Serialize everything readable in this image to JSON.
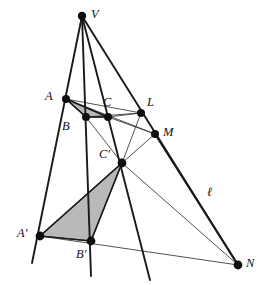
{
  "figure": {
    "width": 267,
    "height": 285,
    "background": "#ffffff",
    "stroke_color": "#1a1a1a",
    "thin_stroke_color": "#333333",
    "shade_color": "#b9b9b9",
    "shade_stroke": "#2a2a2a",
    "label_color": "#111111"
  },
  "points": [
    {
      "id": "V",
      "label": "V",
      "x": 82,
      "y": 16,
      "r": 4.2,
      "label_x": 91,
      "label_y": 8
    },
    {
      "id": "A",
      "label": "A",
      "x": 66,
      "y": 99,
      "r": 4.0,
      "label_x": 45,
      "label_y": 90
    },
    {
      "id": "B",
      "label": "B",
      "x": 86,
      "y": 117,
      "r": 4.0,
      "label_x": 62,
      "label_y": 120
    },
    {
      "id": "C",
      "label": "C",
      "x": 108,
      "y": 117,
      "r": 4.0,
      "label_x": 103,
      "label_y": 96
    },
    {
      "id": "L",
      "label": "L",
      "x": 141,
      "y": 113,
      "r": 4.0,
      "label_x": 147,
      "label_y": 96
    },
    {
      "id": "M",
      "label": "M",
      "x": 155,
      "y": 134,
      "r": 4.0,
      "label_x": 163,
      "label_y": 126
    },
    {
      "id": "Cp",
      "label": "C′",
      "x": 122,
      "y": 163,
      "r": 4.4,
      "label_x": 99,
      "label_y": 148
    },
    {
      "id": "Ap",
      "label": "A′",
      "x": 40,
      "y": 236,
      "r": 4.4,
      "label_x": 17,
      "label_y": 227
    },
    {
      "id": "Bp",
      "label": "B′",
      "x": 91,
      "y": 241,
      "r": 4.4,
      "label_x": 76,
      "label_y": 248
    },
    {
      "id": "N",
      "label": "N",
      "x": 238,
      "y": 265,
      "r": 4.4,
      "label_x": 246,
      "label_y": 257
    }
  ],
  "line_label": {
    "id": "ell",
    "label": "ℓ",
    "x": 207,
    "y": 186
  },
  "shaded_triangles": [
    {
      "id": "triangle-ABC",
      "vertices": "A,B,C",
      "points": "66,99 86,117 108,117"
    },
    {
      "id": "triangle-ApBpCp",
      "vertices": "A',B',C'",
      "points": "40,236 91,241 122,163"
    }
  ],
  "segments": [
    {
      "id": "V-A-Ap-ext",
      "from": "V",
      "to": "beyond A'",
      "weight": "thick",
      "x1": 82,
      "y1": 16,
      "x2": 32,
      "y2": 263
    },
    {
      "id": "V-B-Bp-ext",
      "from": "V",
      "to": "beyond B'",
      "weight": "thick",
      "x1": 82,
      "y1": 16,
      "x2": 91,
      "y2": 276
    },
    {
      "id": "V-C-Cp-ext",
      "from": "V",
      "to": "beyond C'",
      "weight": "thick",
      "x1": 82,
      "y1": 16,
      "x2": 150,
      "y2": 280
    },
    {
      "id": "V-L-N",
      "from": "V",
      "to": "N",
      "weight": "thick",
      "x1": 82,
      "y1": 16,
      "x2": 238,
      "y2": 265
    },
    {
      "id": "A-L-line",
      "from": "A",
      "to": "L",
      "weight": "thin",
      "x1": 66,
      "y1": 99,
      "x2": 141,
      "y2": 113
    },
    {
      "id": "B-L-line",
      "from": "B",
      "to": "L",
      "weight": "thin",
      "x1": 86,
      "y1": 117,
      "x2": 141,
      "y2": 113
    },
    {
      "id": "A-M-line",
      "from": "A",
      "to": "M",
      "weight": "thin",
      "x1": 66,
      "y1": 99,
      "x2": 155,
      "y2": 134
    },
    {
      "id": "C-M-line",
      "from": "C",
      "to": "M",
      "weight": "thin",
      "x1": 108,
      "y1": 117,
      "x2": 155,
      "y2": 134
    },
    {
      "id": "L-Cp-line",
      "from": "L",
      "to": "C'",
      "weight": "thin",
      "x1": 141,
      "y1": 113,
      "x2": 122,
      "y2": 163
    },
    {
      "id": "M-Cp-line",
      "from": "M",
      "to": "C'",
      "weight": "thin",
      "x1": 155,
      "y1": 134,
      "x2": 122,
      "y2": 163
    },
    {
      "id": "B-Cp-line",
      "from": "B",
      "to": "C'",
      "weight": "thin",
      "x1": 86,
      "y1": 117,
      "x2": 122,
      "y2": 163
    },
    {
      "id": "Ap-Bp-N",
      "from": "A'",
      "to": "N",
      "weight": "thin",
      "x1": 40,
      "y1": 236,
      "x2": 238,
      "y2": 265
    },
    {
      "id": "Cp-N-ell",
      "from": "C'",
      "to": "N",
      "weight": "thin",
      "x1": 122,
      "y1": 163,
      "x2": 238,
      "y2": 265
    },
    {
      "id": "M-N-line",
      "from": "M",
      "to": "N",
      "weight": "thick",
      "x1": 155,
      "y1": 134,
      "x2": 238,
      "y2": 265
    },
    {
      "id": "C-Cp-Bp-leg",
      "from": "C'",
      "to": "A'",
      "weight": "thick",
      "x1": 122,
      "y1": 163,
      "x2": 40,
      "y2": 236
    },
    {
      "id": "Cp-Bp-leg",
      "from": "C'",
      "to": "B'",
      "weight": "thick",
      "x1": 122,
      "y1": 163,
      "x2": 91,
      "y2": 241
    },
    {
      "id": "Ap-Bp-leg",
      "from": "A'",
      "to": "B'",
      "weight": "thick",
      "x1": 40,
      "y1": 236,
      "x2": 91,
      "y2": 241
    },
    {
      "id": "A-B-leg",
      "from": "A",
      "to": "B",
      "weight": "thick",
      "x1": 66,
      "y1": 99,
      "x2": 86,
      "y2": 117
    },
    {
      "id": "B-C-leg",
      "from": "B",
      "to": "C",
      "weight": "thick",
      "x1": 86,
      "y1": 117,
      "x2": 108,
      "y2": 117
    },
    {
      "id": "A-C-leg",
      "from": "A",
      "to": "C",
      "weight": "thick",
      "x1": 66,
      "y1": 99,
      "x2": 108,
      "y2": 117
    },
    {
      "id": "C-L-leg",
      "from": "C",
      "to": "L",
      "weight": "thin",
      "x1": 108,
      "y1": 117,
      "x2": 141,
      "y2": 113
    }
  ]
}
